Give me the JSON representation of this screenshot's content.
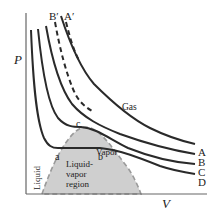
{
  "diagram": {
    "type": "PV isotherms diagram",
    "axes": {
      "x_label": "V",
      "y_label": "P"
    },
    "isotherm_labels": [
      "A",
      "B",
      "C",
      "D"
    ],
    "dashed_labels": [
      "B′",
      "A′"
    ],
    "region_labels": {
      "gas": "Gas",
      "vapor": "Vapor",
      "liquid": "Liquid",
      "liquid_vapor_line1": "Liquid-",
      "liquid_vapor_line2": "vapor",
      "liquid_vapor_line3": "region"
    },
    "point_labels": {
      "a": "a",
      "b": "b",
      "c": "c"
    },
    "colors": {
      "curve": "#2a2a2a",
      "region_fill": "#c8c8c8",
      "region_border": "#999999",
      "axis": "#555555"
    }
  }
}
